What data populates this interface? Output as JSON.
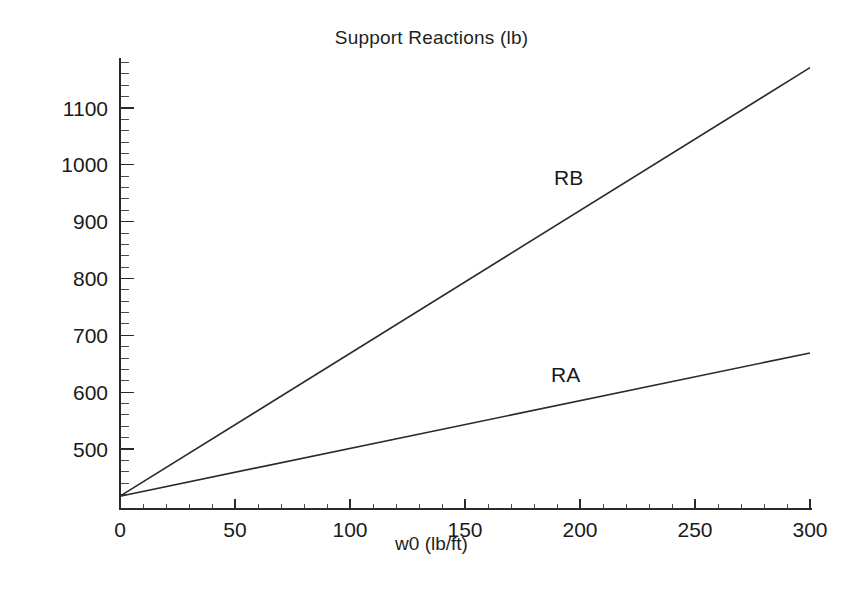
{
  "chart_data": {
    "type": "line",
    "title": "Support Reactions (lb)",
    "xlabel": "w0 (lb/ft)",
    "ylabel": "",
    "xlim": [
      0,
      300
    ],
    "ylim": [
      417,
      1180
    ],
    "grid": false,
    "legend_position": "inline-labels",
    "xticks": [
      0,
      50,
      100,
      150,
      200,
      250,
      300
    ],
    "xtick_labels": [
      "0",
      "50",
      "100",
      "150",
      "200",
      "250",
      "300"
    ],
    "x_minor_step": 10,
    "yticks": [
      500,
      600,
      700,
      800,
      900,
      1000,
      1100
    ],
    "ytick_labels": [
      "500",
      "600",
      "700",
      "800",
      "900",
      "1000",
      "1100"
    ],
    "y_minor_step": 20,
    "x": [
      0,
      300
    ],
    "series": [
      {
        "name": "RA",
        "label": "RA",
        "values": [
          417,
          669
        ],
        "color": "#2b2b2b"
      },
      {
        "name": "RB",
        "label": "RB",
        "values": [
          417,
          1171
        ],
        "color": "#2b2b2b"
      }
    ],
    "annotations": [
      {
        "text": "RB",
        "x": 189,
        "y": 960
      },
      {
        "text": "RA",
        "x": 188,
        "y": 612
      }
    ]
  },
  "figure": {
    "background_color": "#ffffff",
    "axis_color": "#2a2a2a",
    "text_color": "#1a1a1a"
  }
}
